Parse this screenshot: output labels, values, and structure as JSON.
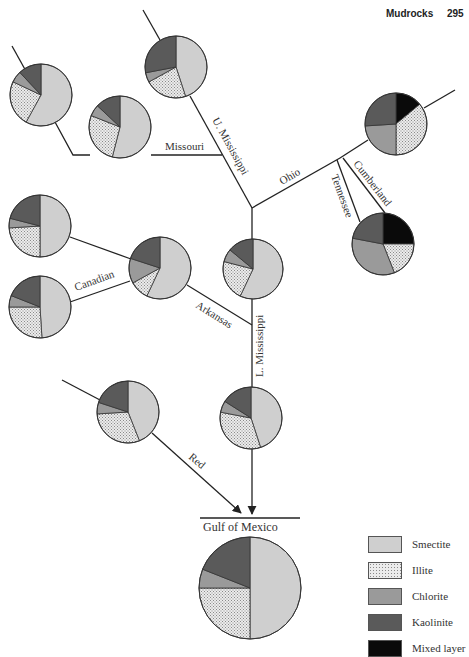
{
  "header": {
    "title": "Mudrocks",
    "page": "295"
  },
  "colors": {
    "smectite": "#cfcfcf",
    "illite": "#e4e4e4",
    "chlorite": "#9a9a9a",
    "kaolinite": "#5a5a5a",
    "mixed_layer": "#0a0a0a",
    "line": "#222222"
  },
  "rivers": {
    "u_mississippi": "U. Mississippi",
    "missouri": "Missouri",
    "ohio": "Ohio",
    "cumberland": "Cumberland",
    "tennessee": "Tennessee",
    "canadian": "Canadian",
    "arkansas": "Arkansas",
    "l_mississippi": "L. Mississippi",
    "red": "Red"
  },
  "destination": {
    "label": "Gulf of Mexico"
  },
  "legend": [
    {
      "key": "smectite",
      "label": "Smectite"
    },
    {
      "key": "illite",
      "label": "Illite"
    },
    {
      "key": "chlorite",
      "label": "Chlorite"
    },
    {
      "key": "kaolinite",
      "label": "Kaolinite"
    },
    {
      "key": "mixed_layer",
      "label": "Mixed layer"
    }
  ],
  "pies": [
    {
      "id": "upper-mississippi",
      "cx": 176,
      "cy": 67,
      "r": 31,
      "slices": [
        [
          "smectite",
          45
        ],
        [
          "illite",
          22
        ],
        [
          "chlorite",
          5
        ],
        [
          "kaolinite",
          28
        ]
      ]
    },
    {
      "id": "missouri-headwater",
      "cx": 41,
      "cy": 95,
      "r": 31,
      "slices": [
        [
          "smectite",
          58
        ],
        [
          "illite",
          24
        ],
        [
          "chlorite",
          6
        ],
        [
          "kaolinite",
          12
        ]
      ]
    },
    {
      "id": "missouri",
      "cx": 120,
      "cy": 127,
      "r": 31,
      "slices": [
        [
          "smectite",
          54
        ],
        [
          "illite",
          27
        ],
        [
          "chlorite",
          6
        ],
        [
          "kaolinite",
          13
        ]
      ]
    },
    {
      "id": "ohio",
      "cx": 396,
      "cy": 124,
      "r": 31,
      "slices": [
        [
          "mixed_layer",
          14
        ],
        [
          "illite",
          36
        ],
        [
          "chlorite",
          24
        ],
        [
          "kaolinite",
          26
        ]
      ]
    },
    {
      "id": "tennessee-cumberland",
      "cx": 383,
      "cy": 244,
      "r": 31,
      "slices": [
        [
          "mixed_layer",
          25
        ],
        [
          "illite",
          19
        ],
        [
          "chlorite",
          34
        ],
        [
          "kaolinite",
          22
        ]
      ]
    },
    {
      "id": "arkansas-headwater",
      "cx": 40,
      "cy": 226,
      "r": 31,
      "slices": [
        [
          "smectite",
          50
        ],
        [
          "illite",
          24
        ],
        [
          "chlorite",
          5
        ],
        [
          "kaolinite",
          21
        ]
      ]
    },
    {
      "id": "canadian",
      "cx": 40,
      "cy": 307,
      "r": 31,
      "slices": [
        [
          "smectite",
          49
        ],
        [
          "illite",
          26
        ],
        [
          "chlorite",
          6
        ],
        [
          "kaolinite",
          19
        ]
      ]
    },
    {
      "id": "arkansas",
      "cx": 160,
      "cy": 268,
      "r": 31,
      "slices": [
        [
          "smectite",
          57
        ],
        [
          "illite",
          10
        ],
        [
          "chlorite",
          13
        ],
        [
          "kaolinite",
          20
        ]
      ]
    },
    {
      "id": "mississippi-mid",
      "cx": 253,
      "cy": 269,
      "r": 30,
      "slices": [
        [
          "smectite",
          57
        ],
        [
          "illite",
          22
        ],
        [
          "chlorite",
          7
        ],
        [
          "kaolinite",
          14
        ]
      ]
    },
    {
      "id": "red",
      "cx": 128,
      "cy": 412,
      "r": 31,
      "slices": [
        [
          "smectite",
          44
        ],
        [
          "illite",
          30
        ],
        [
          "chlorite",
          6
        ],
        [
          "kaolinite",
          20
        ]
      ]
    },
    {
      "id": "lower-mississippi",
      "cx": 251,
      "cy": 418,
      "r": 31,
      "slices": [
        [
          "smectite",
          45
        ],
        [
          "illite",
          33
        ],
        [
          "chlorite",
          6
        ],
        [
          "kaolinite",
          16
        ]
      ]
    },
    {
      "id": "gulf-of-mexico",
      "cx": 250,
      "cy": 588,
      "r": 51,
      "slices": [
        [
          "smectite",
          50
        ],
        [
          "illite",
          25
        ],
        [
          "chlorite",
          6
        ],
        [
          "kaolinite",
          19
        ]
      ]
    }
  ]
}
